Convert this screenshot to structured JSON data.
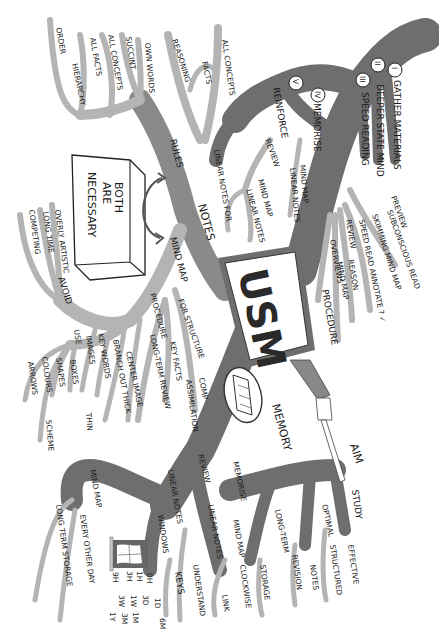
{
  "diagram": {
    "type": "mind-map",
    "orientation": "rotated-90-clockwise",
    "colors": {
      "branch_dark": "#6e6e6e",
      "branch_light": "#b4b4b4",
      "ink": "#1a1a1a",
      "background": "#ffffff"
    },
    "center": {
      "label": "USM"
    },
    "box": {
      "label": "BOTH ARE NECESSARY"
    },
    "aim": {
      "label": "AIM"
    },
    "branches": {
      "procedure": {
        "label": "PROCEDURE",
        "steps": [
          {
            "num": "I",
            "label": "GATHER MATERIALS"
          },
          {
            "num": "II",
            "label": "DEEPER STATE MIND"
          },
          {
            "num": "III",
            "label": "SPEED READING"
          },
          {
            "num": "IV",
            "label": "MEMORISE"
          },
          {
            "num": "V",
            "label": "REINFORCE"
          }
        ],
        "reading_steps": [
          {
            "num": "1",
            "label": "PREVIEW"
          },
          {
            "num": "2",
            "label": "SUBCONSCIOUS READ"
          },
          {
            "num": "3",
            "label": "SKIMMING MIND MAP"
          },
          {
            "num": "4",
            "label": "SPEED READ ANNOTATE ? ✓"
          },
          {
            "num": "5",
            "label": "REVIEW"
          }
        ],
        "extra": [
          "REASON",
          "MIND MAP",
          "OVERVIEWS"
        ],
        "memorise": [
          "MIND MAP",
          "LINEAR NOTES"
        ],
        "reinforce": {
          "review": "REVIEW",
          "items": [
            "MIND MAP",
            "LINEAR NOTES"
          ]
        }
      },
      "notes": {
        "label": "NOTES",
        "rules": {
          "label": "RULES",
          "items": [
            "ORDER",
            "HIERARCHY",
            "ALL FACTS",
            "ALL CONCEPTS",
            "SUCCINT",
            "OWN WORDS"
          ]
        },
        "linear": {
          "label": "LINEAR NOTES FOR",
          "items": [
            "REASONING",
            "FACTS",
            "ALL CONCEPTS"
          ]
        },
        "mind_map": {
          "label": "MIND MAP",
          "avoid": {
            "label": "AVOID",
            "items": [
              "OVERLY ARTISTIC",
              "LONG TIME",
              "COMPETING"
            ]
          },
          "procedure": {
            "label": "PROCEDURE",
            "items": [
              "CENTER IMAGE",
              "BRANCH OUT THICK",
              "THIN",
              "KEY WORDS",
              "IMAGES"
            ]
          },
          "use": {
            "label": "USE",
            "items": [
              "BOXES",
              "SHAPES",
              "COLOURS",
              "SCHEME",
              "ARROWS"
            ]
          },
          "for": {
            "label": "FOR STRUCTURE",
            "items": [
              "LONG-TERM REVIEW",
              "KEY FACTS",
              "COMP",
              "ASSIMILATION"
            ]
          }
        }
      },
      "memory": {
        "label": "MEMORY",
        "review": {
          "label": "REVIEW",
          "mind_map": {
            "label": "MIND MAP",
            "items": [
              "EVERY OTHER DAY",
              "LONG TERM STORAGE"
            ]
          },
          "linear": {
            "label": "LINEAR NOTES",
            "sub": "WINDOWS",
            "schedule": [
              "0H",
              "1H",
              "3H",
              "9H",
              "1D",
              "3D",
              "1W",
              "3W",
              "1M",
              "3M",
              "6M",
              "1Y"
            ]
          }
        },
        "memorise": {
          "label": "MEMORISE",
          "items": [
            "MIND MAP",
            "CLOCKWISE",
            "LINK",
            "LINEAR NOTES",
            "UNDERSTAND",
            "KEYS"
          ]
        }
      },
      "study": {
        "label": "STUDY",
        "optimal": {
          "label": "OPTIMAL",
          "items": [
            "NOTES",
            "REVISION"
          ]
        },
        "effective": {
          "label": "EFFECTIVE",
          "items": [
            "STRUCTURED"
          ]
        },
        "long_term": {
          "label": "LONG-TERM",
          "items": [
            "STORAGE"
          ]
        }
      }
    }
  }
}
